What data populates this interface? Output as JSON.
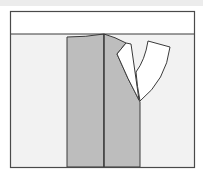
{
  "diagram": {
    "title": "Pattern piece diagram: front panel with folded facing and lapel",
    "colors": {
      "background": "#ffffff",
      "frame_fill_upper": "#ffffff",
      "frame_fill_lower": "#f2f2f2",
      "panel_gray": "#bdbdbd",
      "flap_white": "#ffffff",
      "outline": "#3a3a3a",
      "top_strip": "#ececec"
    },
    "shapes": {
      "frame": {
        "x": 10,
        "y": 11,
        "w": 184,
        "h": 156
      },
      "waistline_y": 34,
      "left_panel": "M67,37 Q86,37 104,34 L104,167 L67,167 Z",
      "right_panel": "M104,34 Q115,37 126,43 L117,54 Q128,80 139,100 L140,102 L140,167 L104,167 Z",
      "center_line": "M104,34 L104,167",
      "facing_flap": "M126,43 L117,54 Q128,80 139,100 L131,44 Z",
      "lapel_flap": "M148,41 L170,47 Q166,80 140,101 Q137,86 136,72 Q145,60 148,41 Z",
      "lapel_inner_line": "M131,44 Q134,72 139,100"
    },
    "labels": {
      "frame": "Cutting layout frame",
      "left_panel": "Back panel",
      "right_panel": "Front panel",
      "facing_flap": "Folded facing",
      "lapel_flap": "Lapel"
    }
  }
}
